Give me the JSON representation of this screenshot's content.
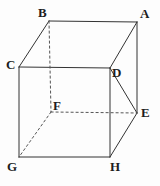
{
  "figure": {
    "name": "cube-diagram",
    "background_color": "#fdfdfd",
    "stroke_color": "#333333",
    "hidden_stroke_color": "#555555",
    "label_color": "#1d1d1d",
    "stroke_width": 1,
    "width": 160,
    "height": 186
  },
  "vertices": [
    {
      "id": "A",
      "label": "A",
      "x": 137,
      "y": 22,
      "label_x": 140,
      "label_y": 7,
      "hidden": false
    },
    {
      "id": "B",
      "label": "B",
      "x": 49,
      "y": 21,
      "label_x": 38,
      "label_y": 6,
      "hidden": false
    },
    {
      "id": "C",
      "label": "C",
      "x": 19,
      "y": 67,
      "label_x": 6,
      "label_y": 58,
      "hidden": false
    },
    {
      "id": "D",
      "label": "D",
      "x": 110,
      "y": 68,
      "label_x": 112,
      "label_y": 66,
      "hidden": false
    },
    {
      "id": "E",
      "label": "E",
      "x": 137,
      "y": 113,
      "label_x": 141,
      "label_y": 106,
      "hidden": false
    },
    {
      "id": "F",
      "label": "F",
      "x": 51,
      "y": 112,
      "label_x": 53,
      "label_y": 99,
      "hidden": true
    },
    {
      "id": "G",
      "label": "G",
      "x": 19,
      "y": 157,
      "label_x": 7,
      "label_y": 160,
      "hidden": false
    },
    {
      "id": "H",
      "label": "H",
      "x": 110,
      "y": 157,
      "label_x": 110,
      "label_y": 160,
      "hidden": false
    }
  ],
  "edges": [
    {
      "id": "edge-BA",
      "from": "B",
      "to": "A",
      "style": "solid"
    },
    {
      "id": "edge-BC",
      "from": "B",
      "to": "C",
      "style": "solid"
    },
    {
      "id": "edge-CD",
      "from": "C",
      "to": "D",
      "style": "solid"
    },
    {
      "id": "edge-AD",
      "from": "A",
      "to": "D",
      "style": "solid"
    },
    {
      "id": "edge-AE",
      "from": "A",
      "to": "E",
      "style": "solid"
    },
    {
      "id": "edge-DE",
      "from": "D",
      "to": "E",
      "style": "solid"
    },
    {
      "id": "edge-CG",
      "from": "C",
      "to": "G",
      "style": "solid"
    },
    {
      "id": "edge-DH",
      "from": "D",
      "to": "H",
      "style": "solid"
    },
    {
      "id": "edge-GH",
      "from": "G",
      "to": "H",
      "style": "solid"
    },
    {
      "id": "edge-HE",
      "from": "H",
      "to": "E",
      "style": "solid"
    },
    {
      "id": "edge-BF",
      "from": "B",
      "to": "F",
      "style": "dashed"
    },
    {
      "id": "edge-FE",
      "from": "F",
      "to": "E",
      "style": "dashed"
    },
    {
      "id": "edge-FG",
      "from": "F",
      "to": "G",
      "style": "dashed"
    }
  ]
}
